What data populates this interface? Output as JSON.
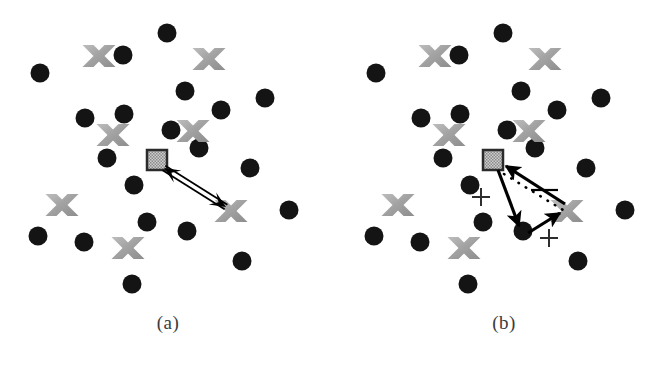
{
  "figure": {
    "background_color": "#ffffff",
    "width": 672,
    "height": 374
  },
  "style": {
    "dot_color": "#141414",
    "x_color": "#a9a9a9",
    "x_color_dark": "#8e8e8e",
    "square_border_color": "#2b2b2b",
    "square_fill_color": "#9a9a9a",
    "arrow_color": "#000000",
    "caption_color": "#3b3b3b"
  },
  "panels": [
    {
      "id": "a",
      "caption": "(a)",
      "dots": [
        {
          "cx": 40,
          "cy": 73
        },
        {
          "cx": 123,
          "cy": 55
        },
        {
          "cx": 167,
          "cy": 33
        },
        {
          "cx": 185,
          "cy": 91
        },
        {
          "cx": 221,
          "cy": 110
        },
        {
          "cx": 265,
          "cy": 98
        },
        {
          "cx": 85,
          "cy": 118
        },
        {
          "cx": 124,
          "cy": 114
        },
        {
          "cx": 171,
          "cy": 130
        },
        {
          "cx": 107,
          "cy": 158
        },
        {
          "cx": 199,
          "cy": 148
        },
        {
          "cx": 250,
          "cy": 168
        },
        {
          "cx": 134,
          "cy": 185
        },
        {
          "cx": 289,
          "cy": 210
        },
        {
          "cx": 38,
          "cy": 236
        },
        {
          "cx": 84,
          "cy": 242
        },
        {
          "cx": 147,
          "cy": 222
        },
        {
          "cx": 187,
          "cy": 231
        },
        {
          "cx": 242,
          "cy": 261
        },
        {
          "cx": 132,
          "cy": 284
        }
      ],
      "crosses": [
        {
          "cx": 99,
          "cy": 56
        },
        {
          "cx": 209,
          "cy": 59
        },
        {
          "cx": 113,
          "cy": 135
        },
        {
          "cx": 193,
          "cy": 131
        },
        {
          "cx": 62,
          "cy": 205
        },
        {
          "cx": 128,
          "cy": 248
        },
        {
          "cx": 231,
          "cy": 211
        }
      ],
      "square": {
        "cx": 157,
        "cy": 160,
        "size": 20
      },
      "arrows": [
        {
          "name": "square-to-x-bidirectional",
          "x1": 164,
          "y1": 168,
          "x2": 226,
          "y2": 207,
          "double_headed": true,
          "style": "double-line"
        }
      ],
      "plus_marks": [],
      "dotted_lines": []
    },
    {
      "id": "b",
      "caption": "(b)",
      "dots": [
        {
          "cx": 40,
          "cy": 73
        },
        {
          "cx": 123,
          "cy": 55
        },
        {
          "cx": 167,
          "cy": 33
        },
        {
          "cx": 185,
          "cy": 91
        },
        {
          "cx": 221,
          "cy": 110
        },
        {
          "cx": 265,
          "cy": 98
        },
        {
          "cx": 85,
          "cy": 118
        },
        {
          "cx": 124,
          "cy": 114
        },
        {
          "cx": 171,
          "cy": 130
        },
        {
          "cx": 107,
          "cy": 158
        },
        {
          "cx": 199,
          "cy": 148
        },
        {
          "cx": 250,
          "cy": 168
        },
        {
          "cx": 134,
          "cy": 185
        },
        {
          "cx": 289,
          "cy": 210
        },
        {
          "cx": 38,
          "cy": 236
        },
        {
          "cx": 84,
          "cy": 242
        },
        {
          "cx": 147,
          "cy": 222
        },
        {
          "cx": 187,
          "cy": 231
        },
        {
          "cx": 242,
          "cy": 261
        },
        {
          "cx": 132,
          "cy": 284
        }
      ],
      "crosses": [
        {
          "cx": 99,
          "cy": 56
        },
        {
          "cx": 209,
          "cy": 59
        },
        {
          "cx": 113,
          "cy": 135
        },
        {
          "cx": 193,
          "cy": 131
        },
        {
          "cx": 62,
          "cy": 205
        },
        {
          "cx": 128,
          "cy": 248
        },
        {
          "cx": 231,
          "cy": 211
        }
      ],
      "square": {
        "cx": 157,
        "cy": 160,
        "size": 20
      },
      "arrows": [
        {
          "name": "square-to-dot",
          "x1": 162,
          "y1": 170,
          "x2": 183,
          "y2": 226,
          "double_headed": false,
          "style": "solid"
        },
        {
          "name": "dot-to-x",
          "x1": 192,
          "y1": 233,
          "x2": 224,
          "y2": 213,
          "double_headed": false,
          "style": "solid"
        },
        {
          "name": "x-to-square",
          "x1": 229,
          "y1": 204,
          "x2": 170,
          "y2": 166,
          "double_headed": false,
          "style": "solid"
        }
      ],
      "dotted_lines": [
        {
          "name": "square-to-x-dotted",
          "x1": 168,
          "y1": 174,
          "x2": 227,
          "y2": 210
        }
      ],
      "tick_marks": [
        {
          "name": "segment-tick",
          "x1": 195,
          "y1": 190,
          "x2": 222,
          "y2": 190
        }
      ],
      "plus_marks": [
        {
          "name": "plus-left",
          "cx": 145,
          "cy": 197
        },
        {
          "name": "plus-right",
          "cx": 213,
          "cy": 238
        }
      ]
    }
  ]
}
